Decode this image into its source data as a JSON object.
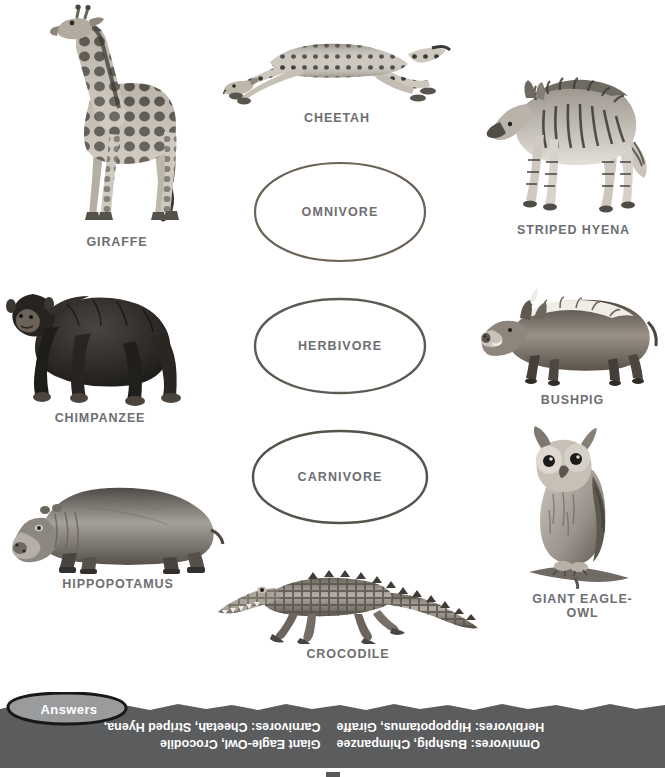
{
  "worksheet": {
    "categories": [
      {
        "id": "omnivore",
        "label": "OMNIVORE"
      },
      {
        "id": "herbivore",
        "label": "HERBIVORE"
      },
      {
        "id": "carnivore",
        "label": "CARNIVORE"
      }
    ],
    "animals": [
      {
        "id": "giraffe",
        "label": "GIRAFFE"
      },
      {
        "id": "cheetah",
        "label": "CHEETAH"
      },
      {
        "id": "striped-hyena",
        "label": "STRIPED HYENA"
      },
      {
        "id": "chimpanzee",
        "label": "CHIMPANZEE"
      },
      {
        "id": "bushpig",
        "label": "BUSHPIG"
      },
      {
        "id": "hippopotamus",
        "label": "HIPPOPOTAMUS"
      },
      {
        "id": "giant-eagle-owl",
        "label": "GIANT EAGLE-\nOWL"
      },
      {
        "id": "crocodile",
        "label": "CROCODILE"
      }
    ],
    "answers": {
      "tab_label": "Answers",
      "left_column": [
        "Carnivores: Cheetah, Striped Hyena,",
        "Giant Eagle-Owl, Crocodile"
      ],
      "right_column": [
        "Herbivores: Hippopotamus, Giraffe",
        "Omnivores: Bushpig, Chimpanzee"
      ]
    },
    "colors": {
      "text": "#6d6e71",
      "oval_stroke": "#6b6257",
      "strip_fill": "#5b5c5e",
      "tab_fill": "#9a9b9d",
      "answer_text": "#ffffff"
    }
  }
}
